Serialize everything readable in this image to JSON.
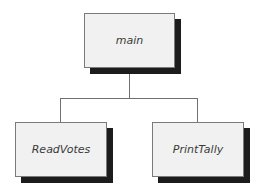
{
  "diagram": {
    "type": "structure-chart",
    "root": {
      "label": "main"
    },
    "children": [
      {
        "label": "ReadVotes"
      },
      {
        "label": "PrintTally"
      }
    ],
    "colors": {
      "box_fill": "#f1f1f1",
      "box_border": "#7a7a7a",
      "shadow": "#1c1c1c",
      "connector": "#707070"
    }
  }
}
